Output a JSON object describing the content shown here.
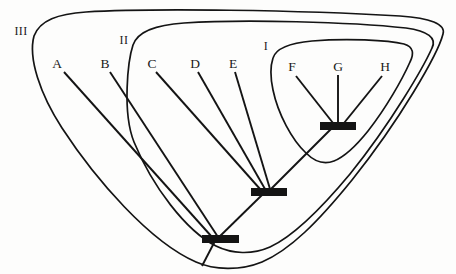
{
  "figure": {
    "type": "cladogram-nested-groups",
    "background_color": "#fdfdfc",
    "ink_color": "#141414",
    "width": 456,
    "height": 274
  },
  "taxa": [
    {
      "id": "A",
      "label": "A",
      "x": 57,
      "y": 63,
      "tip_x": 64,
      "tip_y": 72
    },
    {
      "id": "B",
      "label": "B",
      "x": 105,
      "y": 63,
      "tip_x": 110,
      "tip_y": 72
    },
    {
      "id": "C",
      "label": "C",
      "x": 152,
      "y": 63,
      "tip_x": 156,
      "tip_y": 72
    },
    {
      "id": "D",
      "label": "D",
      "x": 195,
      "y": 63,
      "tip_x": 198,
      "tip_y": 72
    },
    {
      "id": "E",
      "label": "E",
      "x": 233,
      "y": 63,
      "tip_x": 235,
      "tip_y": 72
    },
    {
      "id": "F",
      "label": "F",
      "x": 292,
      "y": 66,
      "tip_x": 296,
      "tip_y": 75
    },
    {
      "id": "G",
      "label": "G",
      "x": 338,
      "y": 66,
      "tip_x": 338,
      "tip_y": 75
    },
    {
      "id": "H",
      "label": "H",
      "x": 385,
      "y": 66,
      "tip_x": 382,
      "tip_y": 75
    }
  ],
  "groups": [
    {
      "id": "I",
      "label": "I",
      "label_x": 266,
      "label_y": 46,
      "members": [
        "F",
        "G",
        "H"
      ]
    },
    {
      "id": "II",
      "label": "II",
      "label_x": 124,
      "label_y": 40,
      "members": [
        "C",
        "D",
        "E",
        "F",
        "G",
        "H"
      ]
    },
    {
      "id": "III",
      "label": "III",
      "label_x": 21,
      "label_y": 31,
      "members": [
        "A",
        "B",
        "C",
        "D",
        "E",
        "F",
        "G",
        "H"
      ]
    }
  ],
  "nodes": [
    {
      "id": "node-I",
      "group": "I",
      "x": 338,
      "y": 126,
      "bar_x": 320,
      "bar_y": 122,
      "bar_w": 36,
      "bar_h": 8
    },
    {
      "id": "node-II",
      "group": "II",
      "x": 268,
      "y": 192,
      "bar_x": 251,
      "bar_y": 188,
      "bar_w": 36,
      "bar_h": 8
    },
    {
      "id": "node-III",
      "group": "III",
      "x": 220,
      "y": 239,
      "bar_x": 202,
      "bar_y": 235,
      "bar_w": 37,
      "bar_h": 8
    }
  ]
}
